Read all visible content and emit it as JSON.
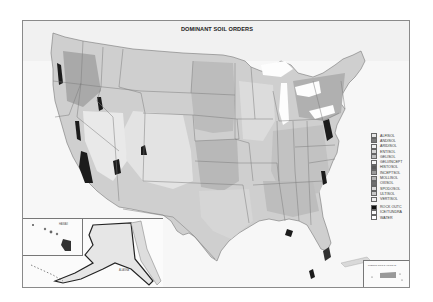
{
  "map": {
    "title": "DOMINANT SOIL ORDERS",
    "insets": {
      "hawaii_label": "HAWAII",
      "alaska_label": "ALASKA",
      "puerto_rico_label": "PUERTO RICO & VIRGIN IS."
    },
    "legend": [
      {
        "label": "ALFISOL",
        "color": "#e6e6e6"
      },
      {
        "label": "ANDISOL",
        "color": "#7a7a7a"
      },
      {
        "label": "ARIDISOL",
        "color": "#efefef"
      },
      {
        "label": "ENTISOL",
        "color": "#d4d4d4"
      },
      {
        "label": "GELISOL",
        "color": "#bdbdbd"
      },
      {
        "label": "GELI/INCEPT",
        "color": "#f5f5f5"
      },
      {
        "label": "HISTOSOL",
        "color": "#5a5a5a"
      },
      {
        "label": "INCEPTSOL",
        "color": "#9a9a9a"
      },
      {
        "label": "MOLLISOL",
        "color": "#b4b4b4"
      },
      {
        "label": "OXISOL",
        "color": "#6e6e6e"
      },
      {
        "label": "SPODOSOL",
        "color": "#dadada"
      },
      {
        "label": "ULTISOL",
        "color": "#c8c8c8"
      },
      {
        "label": "VERTISOL",
        "color": "#f0f0f0"
      },
      {
        "label": "ROCK OUTC",
        "color": "#111111"
      },
      {
        "label": "ICE/TUNDRA",
        "color": "#fafafa"
      },
      {
        "label": "WATER",
        "color": "#ffffff"
      }
    ]
  }
}
